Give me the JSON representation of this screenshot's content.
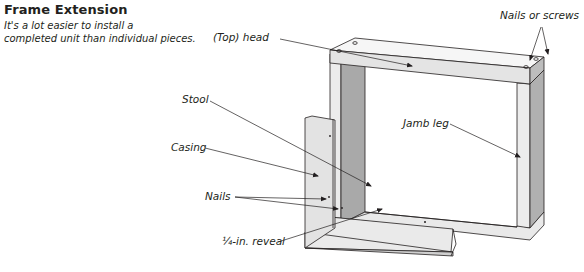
{
  "header": {
    "title": "Frame Extension",
    "subtitle_line1": "It's a lot easier to install a",
    "subtitle_line2": "completed unit than individual pieces."
  },
  "labels": {
    "head": "(Top) head",
    "nails_or_screws": "Nails or screws",
    "stool": "Stool",
    "jamb_leg": "Jamb leg",
    "casing": "Casing",
    "nails": "Nails",
    "reveal": "¼-in. reveal"
  },
  "colors": {
    "line": "#231f20",
    "face_light": "#ececec",
    "face_mid": "#d4d4d4",
    "face_dark": "#a9a9a9"
  }
}
